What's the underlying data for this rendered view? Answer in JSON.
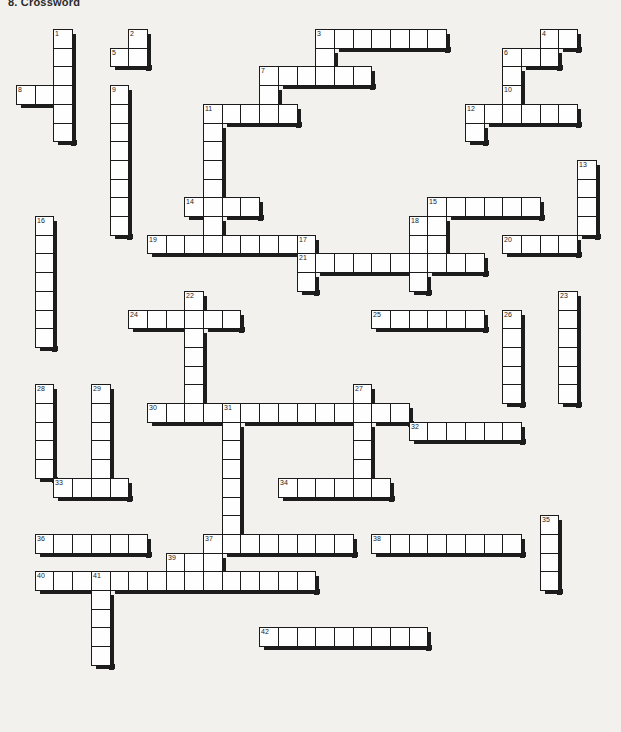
{
  "page": {
    "title": "8. Crossword",
    "type": "crossword-puzzle",
    "width": 621,
    "height": 732,
    "background_color": "#f2f1ed",
    "cell_fill": "#fefefe",
    "cell_border": "#1b1b1b",
    "shadow_color": "#1d1d1d"
  },
  "grid": {
    "origin_x": 16,
    "origin_y": 29,
    "cell_size": 18.7,
    "columns": 32,
    "rows": 37,
    "numbered_clues_total": 42
  },
  "entries": [
    {
      "number": 1,
      "dir": "down",
      "col": 2,
      "row": 0,
      "length": 6
    },
    {
      "number": 2,
      "dir": "down",
      "col": 6,
      "row": 0,
      "length": 2
    },
    {
      "number": 3,
      "dir": "across",
      "col": 16,
      "row": 0,
      "length": 7
    },
    {
      "number": 3,
      "dir": "down",
      "col": 16,
      "row": 0,
      "length": 3
    },
    {
      "number": 4,
      "dir": "down",
      "col": 28,
      "row": 0,
      "length": 2
    },
    {
      "number": 4,
      "dir": "across",
      "col": 28,
      "row": 0,
      "length": 2
    },
    {
      "number": 5,
      "dir": "across",
      "col": 5,
      "row": 1,
      "length": 2
    },
    {
      "number": 6,
      "dir": "across",
      "col": 26,
      "row": 1,
      "length": 2
    },
    {
      "number": 6,
      "dir": "down",
      "col": 26,
      "row": 1,
      "length": 3
    },
    {
      "number": 7,
      "dir": "across",
      "col": 13,
      "row": 2,
      "length": 6
    },
    {
      "number": 7,
      "dir": "down",
      "col": 13,
      "row": 2,
      "length": 2
    },
    {
      "number": 8,
      "dir": "across",
      "col": 0,
      "row": 3,
      "length": 3
    },
    {
      "number": 9,
      "dir": "down",
      "col": 5,
      "row": 3,
      "length": 8
    },
    {
      "number": 10,
      "dir": "down",
      "col": 26,
      "row": 3,
      "length": 2
    },
    {
      "number": 11,
      "dir": "across",
      "col": 10,
      "row": 4,
      "length": 5
    },
    {
      "number": 11,
      "dir": "down",
      "col": 10,
      "row": 4,
      "length": 7
    },
    {
      "number": 12,
      "dir": "across",
      "col": 24,
      "row": 4,
      "length": 6
    },
    {
      "number": 12,
      "dir": "down",
      "col": 24,
      "row": 4,
      "length": 2
    },
    {
      "number": 13,
      "dir": "down",
      "col": 30,
      "row": 7,
      "length": 4
    },
    {
      "number": 14,
      "dir": "across",
      "col": 9,
      "row": 9,
      "length": 4
    },
    {
      "number": 15,
      "dir": "across",
      "col": 22,
      "row": 9,
      "length": 6
    },
    {
      "number": 15,
      "dir": "down",
      "col": 22,
      "row": 9,
      "length": 3
    },
    {
      "number": 16,
      "dir": "down",
      "col": 1,
      "row": 10,
      "length": 7
    },
    {
      "number": 17,
      "dir": "down",
      "col": 15,
      "row": 11,
      "length": 3
    },
    {
      "number": 18,
      "dir": "down",
      "col": 21,
      "row": 10,
      "length": 4
    },
    {
      "number": 19,
      "dir": "across",
      "col": 7,
      "row": 11,
      "length": 8
    },
    {
      "number": 20,
      "dir": "across",
      "col": 26,
      "row": 11,
      "length": 4
    },
    {
      "number": 21,
      "dir": "across",
      "col": 15,
      "row": 12,
      "length": 10
    },
    {
      "number": 22,
      "dir": "down",
      "col": 9,
      "row": 14,
      "length": 6
    },
    {
      "number": 23,
      "dir": "down",
      "col": 29,
      "row": 14,
      "length": 6
    },
    {
      "number": 24,
      "dir": "across",
      "col": 6,
      "row": 15,
      "length": 6
    },
    {
      "number": 25,
      "dir": "across",
      "col": 19,
      "row": 15,
      "length": 6
    },
    {
      "number": 26,
      "dir": "down",
      "col": 26,
      "row": 15,
      "length": 5
    },
    {
      "number": 27,
      "dir": "down",
      "col": 18,
      "row": 19,
      "length": 5
    },
    {
      "number": 28,
      "dir": "down",
      "col": 1,
      "row": 19,
      "length": 5
    },
    {
      "number": 29,
      "dir": "down",
      "col": 4,
      "row": 19,
      "length": 6
    },
    {
      "number": 30,
      "dir": "across",
      "col": 7,
      "row": 20,
      "length": 5
    },
    {
      "number": 31,
      "dir": "across",
      "col": 11,
      "row": 20,
      "length": 10
    },
    {
      "number": 31,
      "dir": "down",
      "col": 11,
      "row": 20,
      "length": 8
    },
    {
      "number": 32,
      "dir": "across",
      "col": 21,
      "row": 21,
      "length": 6
    },
    {
      "number": 33,
      "dir": "across",
      "col": 2,
      "row": 24,
      "length": 4
    },
    {
      "number": 34,
      "dir": "across",
      "col": 14,
      "row": 24,
      "length": 6
    },
    {
      "number": 35,
      "dir": "down",
      "col": 28,
      "row": 26,
      "length": 4
    },
    {
      "number": 36,
      "dir": "across",
      "col": 1,
      "row": 27,
      "length": 6
    },
    {
      "number": 37,
      "dir": "across",
      "col": 10,
      "row": 27,
      "length": 8
    },
    {
      "number": 37,
      "dir": "down",
      "col": 10,
      "row": 27,
      "length": 3
    },
    {
      "number": 38,
      "dir": "across",
      "col": 19,
      "row": 27,
      "length": 8
    },
    {
      "number": 39,
      "dir": "across",
      "col": 8,
      "row": 28,
      "length": 2
    },
    {
      "number": 40,
      "dir": "across",
      "col": 1,
      "row": 29,
      "length": 3
    },
    {
      "number": 41,
      "dir": "across",
      "col": 4,
      "row": 29,
      "length": 12
    },
    {
      "number": 41,
      "dir": "down",
      "col": 4,
      "row": 29,
      "length": 5
    },
    {
      "number": 42,
      "dir": "across",
      "col": 13,
      "row": 32,
      "length": 9
    }
  ],
  "cells": [
    [
      2,
      0
    ],
    [
      2,
      1
    ],
    [
      2,
      2
    ],
    [
      2,
      3
    ],
    [
      2,
      4
    ],
    [
      2,
      5
    ],
    [
      0,
      3
    ],
    [
      1,
      3
    ],
    [
      6,
      0
    ],
    [
      6,
      1
    ],
    [
      5,
      1
    ],
    [
      5,
      3
    ],
    [
      5,
      4
    ],
    [
      5,
      5
    ],
    [
      5,
      6
    ],
    [
      5,
      7
    ],
    [
      5,
      8
    ],
    [
      5,
      9
    ],
    [
      5,
      10
    ],
    [
      16,
      0
    ],
    [
      17,
      0
    ],
    [
      18,
      0
    ],
    [
      19,
      0
    ],
    [
      20,
      0
    ],
    [
      21,
      0
    ],
    [
      22,
      0
    ],
    [
      16,
      1
    ],
    [
      16,
      2
    ],
    [
      28,
      0
    ],
    [
      29,
      0
    ],
    [
      26,
      1
    ],
    [
      27,
      1
    ],
    [
      26,
      2
    ],
    [
      26,
      3
    ],
    [
      27,
      3
    ],
    [
      13,
      2
    ],
    [
      14,
      2
    ],
    [
      15,
      2
    ],
    [
      16,
      2
    ],
    [
      17,
      2
    ],
    [
      18,
      2
    ],
    [
      13,
      3
    ],
    [
      10,
      4
    ],
    [
      11,
      4
    ],
    [
      12,
      4
    ],
    [
      13,
      4
    ],
    [
      14,
      4
    ],
    [
      10,
      5
    ],
    [
      10,
      6
    ],
    [
      10,
      7
    ],
    [
      10,
      8
    ],
    [
      10,
      9
    ],
    [
      10,
      10
    ],
    [
      24,
      4
    ],
    [
      25,
      4
    ],
    [
      26,
      4
    ],
    [
      27,
      4
    ],
    [
      28,
      4
    ],
    [
      29,
      4
    ],
    [
      24,
      5
    ],
    [
      13,
      5
    ],
    [
      13,
      6
    ],
    [
      13,
      7
    ],
    [
      15,
      5
    ],
    [
      15,
      6
    ],
    [
      15,
      7
    ],
    [
      15,
      8
    ],
    [
      30,
      7
    ],
    [
      30,
      8
    ],
    [
      30,
      9
    ],
    [
      30,
      10
    ],
    [
      9,
      9
    ],
    [
      10,
      9
    ],
    [
      11,
      9
    ],
    [
      12,
      9
    ],
    [
      22,
      9
    ],
    [
      23,
      9
    ],
    [
      24,
      9
    ],
    [
      25,
      9
    ],
    [
      26,
      9
    ],
    [
      27,
      9
    ],
    [
      22,
      10
    ],
    [
      22,
      11
    ],
    [
      1,
      10
    ],
    [
      1,
      11
    ],
    [
      1,
      12
    ],
    [
      1,
      13
    ],
    [
      1,
      14
    ],
    [
      1,
      15
    ],
    [
      1,
      16
    ],
    [
      15,
      11
    ],
    [
      15,
      12
    ],
    [
      15,
      13
    ],
    [
      21,
      10
    ],
    [
      21,
      11
    ],
    [
      21,
      12
    ],
    [
      21,
      13
    ],
    [
      7,
      11
    ],
    [
      8,
      11
    ],
    [
      9,
      11
    ],
    [
      10,
      11
    ],
    [
      11,
      11
    ],
    [
      12,
      11
    ],
    [
      13,
      11
    ],
    [
      14,
      11
    ],
    [
      26,
      11
    ],
    [
      27,
      11
    ],
    [
      28,
      11
    ],
    [
      29,
      11
    ],
    [
      15,
      12
    ],
    [
      16,
      12
    ],
    [
      17,
      12
    ],
    [
      18,
      12
    ],
    [
      19,
      12
    ],
    [
      20,
      12
    ],
    [
      21,
      12
    ],
    [
      22,
      12
    ],
    [
      23,
      12
    ],
    [
      24,
      12
    ],
    [
      9,
      14
    ],
    [
      9,
      15
    ],
    [
      9,
      16
    ],
    [
      9,
      17
    ],
    [
      9,
      18
    ],
    [
      9,
      19
    ],
    [
      29,
      14
    ],
    [
      29,
      15
    ],
    [
      29,
      16
    ],
    [
      29,
      17
    ],
    [
      29,
      18
    ],
    [
      29,
      19
    ],
    [
      6,
      15
    ],
    [
      7,
      15
    ],
    [
      8,
      15
    ],
    [
      9,
      15
    ],
    [
      10,
      15
    ],
    [
      11,
      15
    ],
    [
      19,
      15
    ],
    [
      20,
      15
    ],
    [
      21,
      15
    ],
    [
      22,
      15
    ],
    [
      23,
      15
    ],
    [
      24,
      15
    ],
    [
      26,
      15
    ],
    [
      26,
      16
    ],
    [
      26,
      17
    ],
    [
      26,
      18
    ],
    [
      26,
      19
    ],
    [
      18,
      19
    ],
    [
      18,
      20
    ],
    [
      18,
      21
    ],
    [
      18,
      22
    ],
    [
      18,
      23
    ],
    [
      1,
      19
    ],
    [
      1,
      20
    ],
    [
      1,
      21
    ],
    [
      1,
      22
    ],
    [
      1,
      23
    ],
    [
      4,
      19
    ],
    [
      4,
      20
    ],
    [
      4,
      21
    ],
    [
      4,
      22
    ],
    [
      4,
      23
    ],
    [
      4,
      24
    ],
    [
      7,
      20
    ],
    [
      8,
      20
    ],
    [
      9,
      20
    ],
    [
      10,
      20
    ],
    [
      11,
      20
    ],
    [
      11,
      20
    ],
    [
      12,
      20
    ],
    [
      13,
      20
    ],
    [
      14,
      20
    ],
    [
      15,
      20
    ],
    [
      16,
      20
    ],
    [
      17,
      20
    ],
    [
      18,
      20
    ],
    [
      19,
      20
    ],
    [
      20,
      20
    ],
    [
      11,
      21
    ],
    [
      11,
      22
    ],
    [
      11,
      23
    ],
    [
      11,
      24
    ],
    [
      11,
      25
    ],
    [
      11,
      26
    ],
    [
      11,
      27
    ],
    [
      21,
      21
    ],
    [
      22,
      21
    ],
    [
      23,
      21
    ],
    [
      24,
      21
    ],
    [
      25,
      21
    ],
    [
      26,
      21
    ],
    [
      2,
      24
    ],
    [
      3,
      24
    ],
    [
      4,
      24
    ],
    [
      5,
      24
    ],
    [
      14,
      24
    ],
    [
      15,
      24
    ],
    [
      16,
      24
    ],
    [
      17,
      24
    ],
    [
      18,
      24
    ],
    [
      19,
      24
    ],
    [
      28,
      26
    ],
    [
      28,
      27
    ],
    [
      28,
      28
    ],
    [
      28,
      29
    ],
    [
      1,
      27
    ],
    [
      2,
      27
    ],
    [
      3,
      27
    ],
    [
      4,
      27
    ],
    [
      5,
      27
    ],
    [
      6,
      27
    ],
    [
      10,
      27
    ],
    [
      11,
      27
    ],
    [
      12,
      27
    ],
    [
      13,
      27
    ],
    [
      14,
      27
    ],
    [
      15,
      27
    ],
    [
      16,
      27
    ],
    [
      17,
      27
    ],
    [
      10,
      28
    ],
    [
      10,
      29
    ],
    [
      19,
      27
    ],
    [
      20,
      27
    ],
    [
      21,
      27
    ],
    [
      22,
      27
    ],
    [
      23,
      27
    ],
    [
      24,
      27
    ],
    [
      25,
      27
    ],
    [
      26,
      27
    ],
    [
      8,
      28
    ],
    [
      9,
      28
    ],
    [
      1,
      29
    ],
    [
      2,
      29
    ],
    [
      3,
      29
    ],
    [
      4,
      29
    ],
    [
      5,
      29
    ],
    [
      6,
      29
    ],
    [
      7,
      29
    ],
    [
      8,
      29
    ],
    [
      9,
      29
    ],
    [
      10,
      29
    ],
    [
      11,
      29
    ],
    [
      12,
      29
    ],
    [
      13,
      29
    ],
    [
      14,
      29
    ],
    [
      15,
      29
    ],
    [
      4,
      30
    ],
    [
      4,
      31
    ],
    [
      4,
      32
    ],
    [
      4,
      33
    ],
    [
      10,
      30
    ],
    [
      10,
      31
    ],
    [
      10,
      32
    ],
    [
      10,
      33
    ],
    [
      13,
      32
    ],
    [
      14,
      32
    ],
    [
      15,
      32
    ],
    [
      16,
      32
    ],
    [
      17,
      32
    ],
    [
      18,
      32
    ],
    [
      19,
      32
    ],
    [
      20,
      32
    ],
    [
      21,
      32
    ]
  ]
}
